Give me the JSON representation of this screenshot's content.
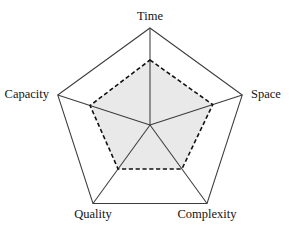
{
  "chart_data": {
    "type": "radar",
    "title": "",
    "subtitle": "",
    "xlabel": "",
    "ylabel": "",
    "categories": [
      "Time",
      "Space",
      "Complexity",
      "Quality",
      "Capacity"
    ],
    "series": [
      {
        "name": "outer-boundary",
        "values": [
          1.0,
          1.0,
          1.0,
          1.0,
          1.0
        ],
        "style": "solid",
        "fill": "none",
        "stroke": "#3c3c3c"
      },
      {
        "name": "inner-region",
        "values": [
          0.67,
          0.68,
          0.56,
          0.56,
          0.65
        ],
        "style": "dashed",
        "fill": "#e9e9e9",
        "stroke": "#111111"
      }
    ],
    "rlim": [
      0,
      1
    ],
    "grid": false,
    "legend": "none",
    "axis_spokes": true,
    "annotations": []
  },
  "labels": {
    "top": "Time",
    "right": "Space",
    "bottom_right": "Complexity",
    "bottom_left": "Quality",
    "left": "Capacity"
  },
  "colors": {
    "background": "#ffffff",
    "outer_stroke": "#3c3c3c",
    "spoke_stroke": "#3c3c3c",
    "inner_stroke": "#111111",
    "inner_fill": "#e9e9e9",
    "label_text": "#141414"
  },
  "geometry": {
    "center_x": 150,
    "center_y": 125,
    "outer_radius": 97,
    "vertex_angles_deg": [
      90,
      18,
      306,
      234,
      162
    ]
  }
}
